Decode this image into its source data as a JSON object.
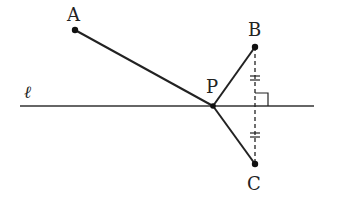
{
  "diagram": {
    "labels": {
      "A": "A",
      "B": "B",
      "C": "C",
      "P": "P",
      "line": "ℓ"
    },
    "points": {
      "A": [
        75,
        30
      ],
      "B": [
        255,
        47
      ],
      "C": [
        255,
        164
      ],
      "P": [
        213,
        106
      ]
    },
    "line_l": {
      "x1": 20,
      "y1": 106,
      "x2": 314,
      "y2": 106
    },
    "stroke_color": "#222222"
  }
}
